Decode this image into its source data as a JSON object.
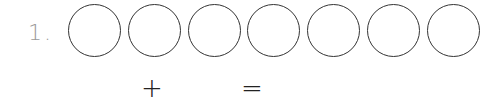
{
  "problem": {
    "number": "1.",
    "circle_count": 7,
    "circles": [
      "",
      "",
      "",
      "",
      "",
      "",
      ""
    ],
    "operators": {
      "plus": "+",
      "equals": "="
    }
  }
}
